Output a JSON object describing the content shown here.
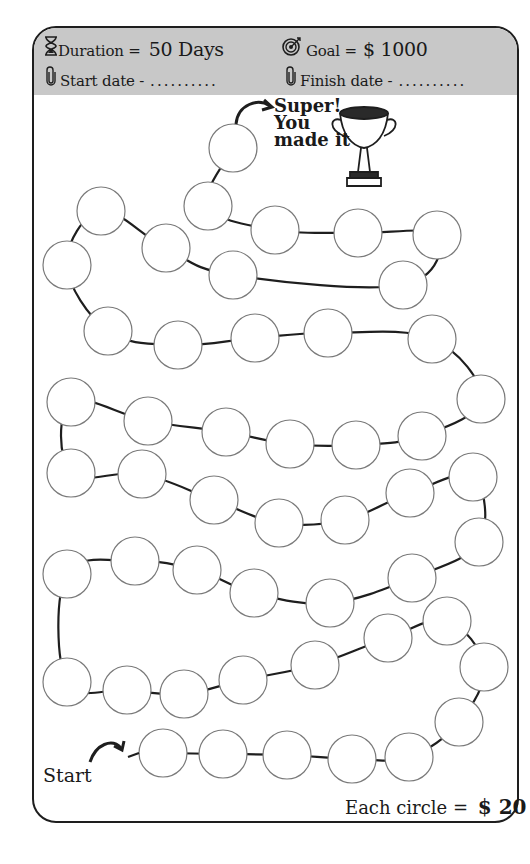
{
  "header": {
    "duration_label": "Duration =",
    "duration_value": "50 Days",
    "goal_label": "Goal =",
    "goal_value": "$ 1000",
    "start_date_label": "Start date -",
    "start_date_value": "..........",
    "finish_date_label": "Finish date -",
    "finish_date_value": "..........",
    "icons": {
      "duration": "hourglass-icon",
      "goal": "target-icon",
      "start": "paperclip-icon",
      "finish": "paperclip-icon"
    }
  },
  "finish": {
    "line1": "Super!",
    "line2": "You",
    "line3": "made it",
    "icon": "trophy-icon"
  },
  "start_label": "Start",
  "footer": {
    "each_circle_label": "Each circle =",
    "each_circle_value": "$ 20"
  },
  "board": {
    "circle_count": 50,
    "circle_radius": 24,
    "colors": {
      "header_bg": "#c8c8c8",
      "stroke": "#1e1e1e",
      "circle_stroke": "#7a7a7a"
    },
    "path_order_from_start": [
      [
        163,
        753
      ],
      [
        223,
        754
      ],
      [
        287,
        755
      ],
      [
        352,
        759
      ],
      [
        409,
        757
      ],
      [
        459,
        722
      ],
      [
        484,
        667
      ],
      [
        447,
        621
      ],
      [
        388,
        638
      ],
      [
        315,
        665
      ],
      [
        243,
        680
      ],
      [
        184,
        694
      ],
      [
        127,
        690
      ],
      [
        67,
        682
      ],
      [
        67,
        574
      ],
      [
        135,
        561
      ],
      [
        197,
        570
      ],
      [
        254,
        593
      ],
      [
        330,
        603
      ],
      [
        412,
        578
      ],
      [
        479,
        542
      ],
      [
        473,
        477
      ],
      [
        410,
        493
      ],
      [
        345,
        520
      ],
      [
        279,
        523
      ],
      [
        214,
        500
      ],
      [
        142,
        474
      ],
      [
        71,
        473
      ],
      [
        71,
        402
      ],
      [
        148,
        421
      ],
      [
        226,
        432
      ],
      [
        290,
        444
      ],
      [
        356,
        445
      ],
      [
        422,
        436
      ],
      [
        481,
        399
      ],
      [
        432,
        339
      ],
      [
        328,
        333
      ],
      [
        255,
        338
      ],
      [
        178,
        345
      ],
      [
        108,
        331
      ],
      [
        67,
        265
      ],
      [
        101,
        211
      ],
      [
        166,
        248
      ],
      [
        233,
        275
      ],
      [
        403,
        285
      ],
      [
        437,
        235
      ],
      [
        358,
        233
      ],
      [
        275,
        230
      ],
      [
        208,
        206
      ],
      [
        233,
        148
      ]
    ]
  }
}
